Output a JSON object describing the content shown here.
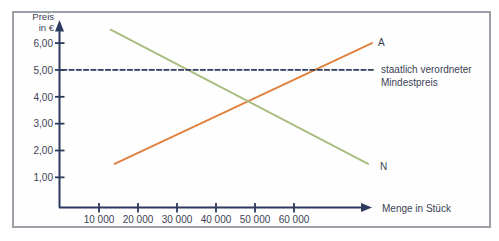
{
  "figure": {
    "background": "#ffffff",
    "frame_border_color": "#9ba1a6"
  },
  "chart_data": {
    "type": "line",
    "title": "",
    "xlabel": "Menge in Stück",
    "ylabel": "Preis in €",
    "ylabel_display": "Preis\nin €",
    "xlim": [
      0,
      80000
    ],
    "ylim": [
      0,
      6.6
    ],
    "grid": false,
    "axis_color": "#2d3a5e",
    "text_color": "#3c4254",
    "xtick_values": [
      10000,
      20000,
      30000,
      40000,
      50000,
      60000
    ],
    "xtick_labels": [
      "10 000",
      "20 000",
      "30 000",
      "40 000",
      "50 000",
      "60 000"
    ],
    "ytick_values": [
      6,
      5,
      4,
      3,
      2,
      1
    ],
    "ytick_labels": [
      "6,00",
      "5,00",
      "4,00",
      "3,00",
      "2,00",
      "1,00"
    ],
    "series": [
      {
        "name": "A",
        "type": "line",
        "style": "solid",
        "color": "#e0813f",
        "points": [
          [
            14000,
            1.5
          ],
          [
            80000,
            6.0
          ]
        ]
      },
      {
        "name": "N",
        "type": "line",
        "style": "solid",
        "color": "#a9bd80",
        "points": [
          [
            13000,
            6.5
          ],
          [
            79000,
            1.5
          ]
        ]
      },
      {
        "name": "staatlich verordneter Mindestpreis",
        "type": "reference-line",
        "style": "dashed",
        "color": "#303c5c",
        "points": [
          [
            500,
            5.0
          ],
          [
            80500,
            5.0
          ]
        ]
      }
    ],
    "annotations": {
      "series_a_label": "A",
      "series_n_label": "N",
      "min_price_label": "staatlich verordneter\nMindestpreis"
    }
  }
}
